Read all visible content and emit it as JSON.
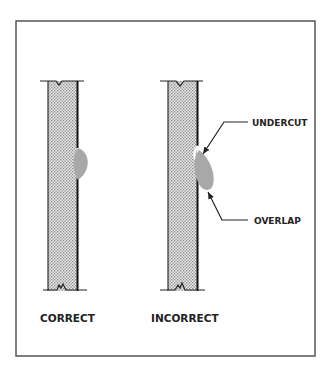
{
  "diagram": {
    "title": "",
    "colors": {
      "frame": "#555555",
      "ink": "#222222",
      "plate_fill": "#e6e6e6",
      "plate_dots": "#8a8a8a",
      "weld_bead": "#a8a8a8",
      "undercut_highlight": "#ffffff"
    },
    "panels": [
      {
        "id": "correct",
        "caption": "CORRECT",
        "weld": "flush bead, no defects"
      },
      {
        "id": "incorrect",
        "caption": "INCORRECT",
        "weld": "bead with undercut and overlap",
        "callouts": [
          {
            "id": "undercut",
            "label": "UNDERCUT"
          },
          {
            "id": "overlap",
            "label": "OVERLAP"
          }
        ]
      }
    ]
  }
}
